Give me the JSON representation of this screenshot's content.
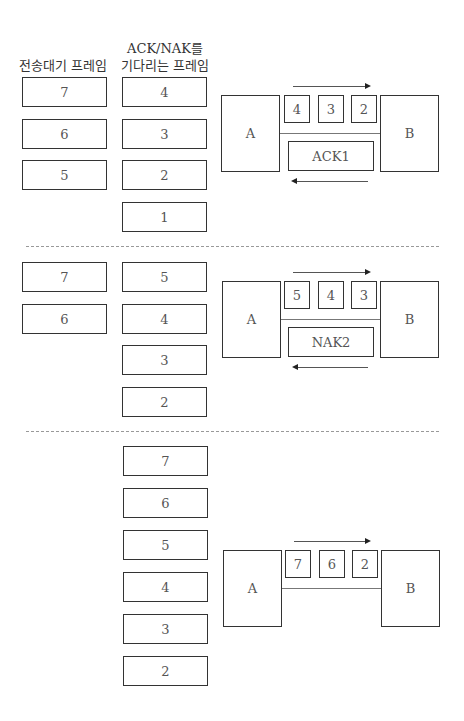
{
  "headers": {
    "pending_frames": "전송대기 프레임",
    "awaiting_ack_line1": "ACK/NAK를",
    "awaiting_ack_line2": "기다리는 프레임"
  },
  "nodes": {
    "sender": "A",
    "receiver": "B"
  },
  "stages": [
    {
      "pending": [
        "7",
        "6",
        "5"
      ],
      "awaiting": [
        "4",
        "3",
        "2",
        "1"
      ],
      "in_transit": [
        "4",
        "3",
        "2"
      ],
      "response": "ACK1"
    },
    {
      "pending": [
        "7",
        "6"
      ],
      "awaiting": [
        "5",
        "4",
        "3",
        "2"
      ],
      "in_transit": [
        "5",
        "4",
        "3"
      ],
      "response": "NAK2"
    },
    {
      "pending": [],
      "awaiting": [
        "7",
        "6",
        "5",
        "4",
        "3",
        "2"
      ],
      "in_transit": [
        "7",
        "6",
        "2"
      ],
      "response": ""
    }
  ]
}
